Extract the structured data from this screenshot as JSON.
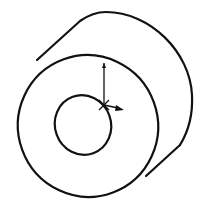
{
  "diagram": {
    "kind": "isometric-cad-part",
    "part": "cylindrical washer / bushing with through hole",
    "elements": [
      "back-face-ellipse",
      "front-face-outer-ellipse",
      "inner-hole-ellipse",
      "top-tangent-edge",
      "bottom-tangent-edge",
      "coordinate-axis-triad"
    ],
    "colors": {
      "line": "#111111",
      "background": "#ffffff"
    }
  }
}
